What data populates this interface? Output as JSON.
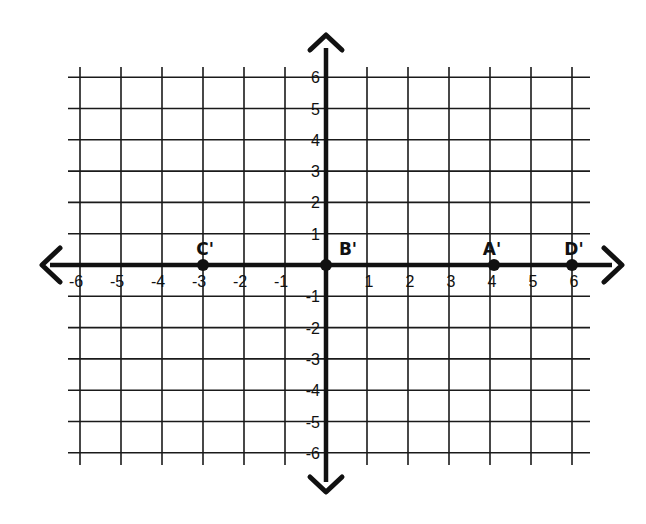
{
  "chart_data": {
    "type": "scatter",
    "title": "",
    "xlabel": "",
    "ylabel": "",
    "xlim": [
      -6,
      6
    ],
    "ylim": [
      -6,
      6
    ],
    "grid": true,
    "x_ticks": [
      "-6",
      "-5",
      "-4",
      "-3",
      "-2",
      "-1",
      "1",
      "2",
      "3",
      "4",
      "5",
      "6"
    ],
    "y_ticks": [
      "6",
      "5",
      "4",
      "3",
      "2",
      "1",
      "-1",
      "-2",
      "-3",
      "-4",
      "-5",
      "-6"
    ],
    "points": [
      {
        "label": "C'",
        "x": -3,
        "y": 0
      },
      {
        "label": "B'",
        "x": 0,
        "y": 0
      },
      {
        "label": "A'",
        "x": 4,
        "y": 0
      },
      {
        "label": "D'",
        "x": 6,
        "y": 0
      }
    ],
    "series": [
      {
        "name": "Image points",
        "x": [
          -3,
          0,
          4,
          6
        ],
        "y": [
          0,
          0,
          0,
          0
        ],
        "labels": [
          "C'",
          "B'",
          "A'",
          "D'"
        ]
      }
    ],
    "colors": {
      "ink": "#111111",
      "background": "#ffffff"
    }
  }
}
